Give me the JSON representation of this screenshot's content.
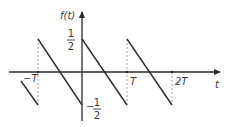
{
  "figure": {
    "y_axis_label": "f(t)",
    "x_axis_label": "t",
    "ticks": {
      "neg_T": "−T",
      "T": "T",
      "two_T": "2T"
    },
    "y_values": {
      "top_num": "1",
      "top_den": "2",
      "bottom_sign": "−",
      "bottom_num": "1",
      "bottom_den": "2"
    },
    "colors": {
      "line": "#2b2b2b",
      "dashed": "#8a8a8a",
      "text": "#3a3a3a"
    }
  },
  "waveform": {
    "type": "sawtooth",
    "amplitude_max": 0.5,
    "amplitude_min": -0.5,
    "period_label": "T",
    "segments": [
      {
        "t_start": "-1.33T",
        "f_start": -0.17,
        "t_end": "-T",
        "f_end": -0.5
      },
      {
        "t_start": "-T",
        "f_start": 0.5,
        "t_end": "0",
        "f_end": -0.5
      },
      {
        "t_start": "0",
        "f_start": 0.5,
        "t_end": "T",
        "f_end": -0.5
      },
      {
        "t_start": "T",
        "f_start": 0.5,
        "t_end": "2T",
        "f_end": -0.5
      }
    ]
  }
}
